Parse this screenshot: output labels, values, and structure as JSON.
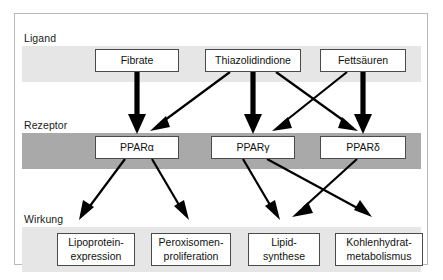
{
  "diagram": {
    "title_visible": false,
    "tiers": [
      {
        "id": "ligand",
        "label": "Ligand",
        "band_color": "#e6e6e6"
      },
      {
        "id": "rezeptor",
        "label": "Rezeptor",
        "band_color": "#a9a9a9"
      },
      {
        "id": "wirkung",
        "label": "Wirkung",
        "band_color": "#e6e6e6"
      }
    ],
    "ligands": [
      {
        "id": "fibrate",
        "label": "Fibrate"
      },
      {
        "id": "thiazolidindione",
        "label": "Thiazolidindione"
      },
      {
        "id": "fettsaeuren",
        "label": "Fettsäuren"
      }
    ],
    "receptors": [
      {
        "id": "ppar-alpha",
        "label": "PPARα"
      },
      {
        "id": "ppar-gamma",
        "label": "PPARγ"
      },
      {
        "id": "ppar-delta",
        "label": "PPARδ"
      }
    ],
    "effects": [
      {
        "id": "lipoprotein",
        "line1": "Lipoprotein-",
        "line2": "expression"
      },
      {
        "id": "peroxisomen",
        "line1": "Peroxisomen-",
        "line2": "proliferation"
      },
      {
        "id": "lipid",
        "line1": "Lipid-",
        "line2": "synthese"
      },
      {
        "id": "kohlenhydrat",
        "line1": "Kohlenhydrat-",
        "line2": "metabolismus"
      }
    ],
    "edges": [
      {
        "from": "fibrate",
        "to": "ppar-alpha",
        "weight": "thick"
      },
      {
        "from": "thiazolidindione",
        "to": "ppar-alpha",
        "weight": "thin"
      },
      {
        "from": "thiazolidindione",
        "to": "ppar-gamma",
        "weight": "thick"
      },
      {
        "from": "thiazolidindione",
        "to": "ppar-delta",
        "weight": "thin"
      },
      {
        "from": "fettsaeuren",
        "to": "ppar-gamma",
        "weight": "thin"
      },
      {
        "from": "fettsaeuren",
        "to": "ppar-delta",
        "weight": "thick"
      },
      {
        "from": "ppar-alpha",
        "to": "lipoprotein",
        "weight": "thin"
      },
      {
        "from": "ppar-alpha",
        "to": "peroxisomen",
        "weight": "thin"
      },
      {
        "from": "ppar-gamma",
        "to": "lipid",
        "weight": "thin"
      },
      {
        "from": "ppar-gamma",
        "to": "kohlenhydrat",
        "weight": "thin"
      },
      {
        "from": "ppar-delta",
        "to": "lipid",
        "weight": "thin"
      }
    ],
    "colors": {
      "frame_border": "#b9b9b9",
      "node_border": "#4a4a4a",
      "node_fill": "#ffffff",
      "arrow": "#000000",
      "text": "#111111"
    }
  }
}
